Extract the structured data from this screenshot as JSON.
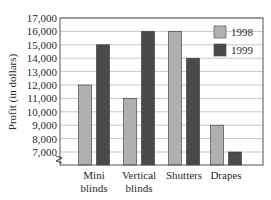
{
  "chart_data": {
    "type": "bar",
    "title": "",
    "xlabel": "",
    "ylabel": "Profit (in dollars)",
    "categories": [
      "Mini blinds",
      "Vertical blinds",
      "Shutters",
      "Drapes"
    ],
    "category_lines": [
      [
        "Mini",
        "blinds"
      ],
      [
        "Vertical",
        "blinds"
      ],
      [
        "Shutters"
      ],
      [
        "Drapes"
      ]
    ],
    "series": [
      {
        "name": "1998",
        "color": "#b0b0b0",
        "values": [
          12000,
          11000,
          16000,
          9000
        ]
      },
      {
        "name": "1999",
        "color": "#4a4a4a",
        "values": [
          15000,
          16000,
          14000,
          7000
        ]
      }
    ],
    "ylim": [
      6000,
      17000
    ],
    "axis_break": true,
    "yticks": [
      7000,
      8000,
      9000,
      10000,
      11000,
      12000,
      13000,
      14000,
      15000,
      16000,
      17000
    ],
    "ytick_labels": [
      "7,000",
      "8,000",
      "9,000",
      "10,000",
      "11,000",
      "12,000",
      "13,000",
      "14,000",
      "15,000",
      "16,000",
      "17,000"
    ],
    "grid": true,
    "legend_position": "upper right"
  }
}
